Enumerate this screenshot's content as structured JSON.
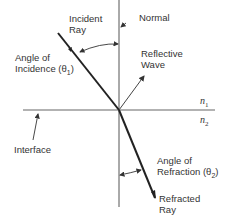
{
  "diagram": {
    "labels": {
      "incident_ray": [
        "Incident",
        "Ray"
      ],
      "normal": "Normal",
      "angle_incidence": [
        "Angle of",
        "Incidence (θ",
        "1",
        ")"
      ],
      "reflective_wave": [
        "Reflective",
        "Wave"
      ],
      "n1": "n",
      "n1_sub": "1",
      "n2": "n",
      "n2_sub": "2",
      "interface": "Interface",
      "angle_refraction": [
        "Angle of",
        "Refraction (θ",
        "2",
        ")"
      ],
      "refracted_ray": [
        "Refracted",
        "Ray"
      ]
    },
    "colors": {
      "line": "#222222",
      "thin_line": "#555555",
      "background": "#ffffff"
    }
  }
}
